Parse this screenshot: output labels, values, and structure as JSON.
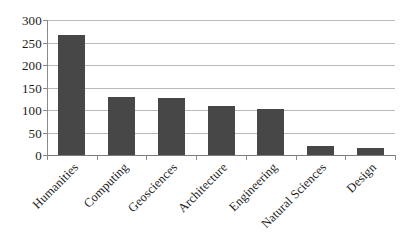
{
  "chart_data": {
    "type": "bar",
    "title": "",
    "subtitle": "",
    "xlabel": "",
    "ylabel": "",
    "categories": [
      "Humanities",
      "Computing",
      "Geosciences",
      "Architecture",
      "Engineering",
      "Natural Sciences",
      "Design"
    ],
    "values": [
      267,
      130,
      127,
      110,
      103,
      20,
      15
    ],
    "ylim": [
      0,
      300
    ],
    "yticks": [
      0,
      50,
      100,
      150,
      200,
      250,
      300
    ],
    "ytick_labels": [
      "0",
      "50",
      "100",
      "150",
      "200",
      "250",
      "300"
    ],
    "grid": true,
    "grid_axis": "y",
    "legend": false,
    "legend_position": "none",
    "bar_color": "#474747",
    "gridline_color": "#b9b9b9",
    "axis_color": "#8a8a8a",
    "background_color": "#ffffff",
    "xtick_label_rotation": -45
  }
}
